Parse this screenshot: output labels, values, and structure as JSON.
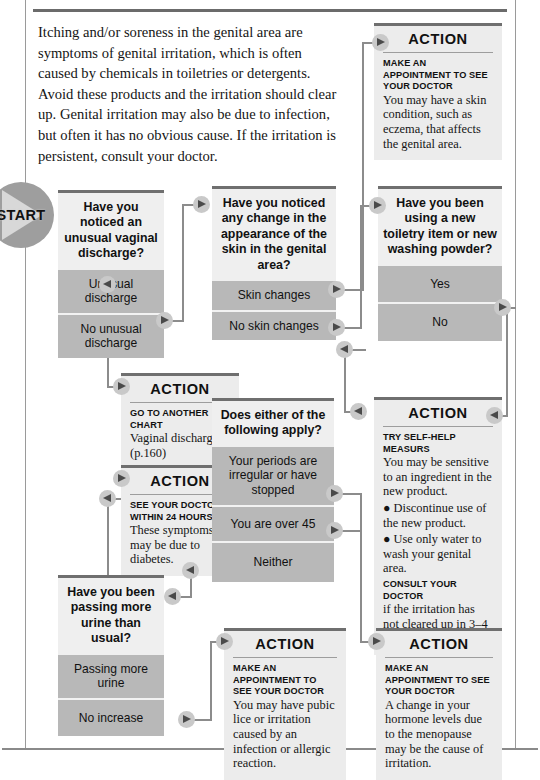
{
  "chart": {
    "type": "flowchart",
    "start_label": "START",
    "intro": "Itching and/or soreness in the genital area are symptoms of genital irritation, which is often caused by chemicals in toiletries or detergents. Avoid these products and the irritation should clear up. Genital irritation may also be due to infection, but often it has no obvious cause. If the irritation is persistent, consult your doctor."
  },
  "q1": {
    "question": "Have you noticed an unusual vaginal discharge?",
    "options": [
      "Unusual discharge",
      "No unusual discharge"
    ]
  },
  "q2": {
    "question": "Have you noticed any change in the appearance of the skin in the genital area?",
    "options": [
      "Skin changes",
      "No skin changes"
    ]
  },
  "q3": {
    "question": "Have you been using a new toiletry item or new washing powder?",
    "options": [
      "Yes",
      "No"
    ]
  },
  "q4": {
    "question": "Does either of the following apply?",
    "options": [
      "Your periods are irregular or have stopped",
      "You are over 45",
      "Neither"
    ]
  },
  "q5": {
    "question": "Have you been passing more urine than usual?",
    "options": [
      "Passing more urine",
      "No increase"
    ]
  },
  "a_skin": {
    "title": "ACTION",
    "lead": "MAKE AN APPOINTMENT TO SEE YOUR DOCTOR",
    "body": "You may have a skin condition, such as eczema, that affects the genital area."
  },
  "a_chart": {
    "title": "ACTION",
    "lead": "GO TO ANOTHER CHART",
    "body": "Vaginal discharge (p.160)"
  },
  "a_diabetes": {
    "title": "ACTION",
    "lead": "SEE YOUR DOCTOR WITHIN 24 HOURS",
    "body": "These symptoms may be due to diabetes."
  },
  "a_selfhelp": {
    "title": "ACTION",
    "lead": "TRY SELF-HELP MEASURS",
    "body": "You may be sensitive to an ingredient in the new product.",
    "bullet1": "● Discontinue use of the new product.",
    "bullet2": "●  Use only water to wash your genital area.",
    "lead2": "CONSULT YOUR DOCTOR",
    "body2": "if the irritation has not cleared up in 3–4 days."
  },
  "a_lice": {
    "title": "ACTION",
    "lead": "MAKE AN APPOINTMENT TO SEE YOUR DOCTOR",
    "body": "You may have pubic lice or irritation caused by an infection or allergic reaction."
  },
  "a_menopause": {
    "title": "ACTION",
    "lead": "MAKE AN APPOINTMENT TO SEE YOUR DOCTOR",
    "body": "A change in your hormone levels due to the menopause may be the cause of irritation."
  }
}
